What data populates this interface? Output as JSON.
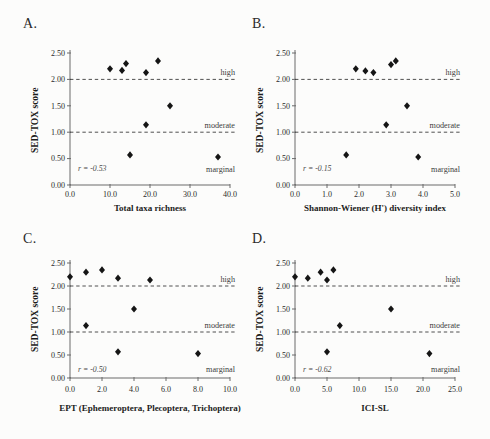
{
  "figure": {
    "background": "#fcfcfb",
    "text_color": "#1c1c1c",
    "marker_color": "#151515"
  },
  "chart_data": [
    {
      "type": "scatter",
      "panel": "A.",
      "xlabel": "Total taxa richness",
      "ylabel": "SED-TOX score",
      "xlim": [
        0,
        40
      ],
      "ylim": [
        0,
        2.5
      ],
      "x_tick_values": [
        0,
        10,
        20,
        30,
        40
      ],
      "x_tick_labels": [
        "0.0",
        "10.0",
        "20.0",
        "30.0",
        "40.0"
      ],
      "y_tick_values": [
        0,
        0.5,
        1,
        1.5,
        2,
        2.5
      ],
      "y_tick_labels": [
        "0.00",
        "0.50",
        "1.00",
        "1.50",
        "2.00",
        "2.50"
      ],
      "points": [
        [
          10,
          2.2
        ],
        [
          13,
          2.17
        ],
        [
          14,
          2.3
        ],
        [
          19,
          2.13
        ],
        [
          22,
          2.35
        ],
        [
          25,
          1.5
        ],
        [
          19,
          1.14
        ],
        [
          15,
          0.57
        ],
        [
          37,
          0.53
        ]
      ],
      "r_label": "r = -0.53",
      "reference_lines": [
        {
          "value": 2.0,
          "label": "high"
        },
        {
          "value": 1.0,
          "label": "moderate"
        }
      ],
      "marginal_label": "marginal",
      "legend": "none",
      "grid": false
    },
    {
      "type": "scatter",
      "panel": "B.",
      "xlabel": "Shannon-Wiener (H') diversity index",
      "ylabel": "SED-TOX score",
      "xlim": [
        0,
        5
      ],
      "ylim": [
        0,
        2.5
      ],
      "x_tick_values": [
        0,
        1,
        2,
        3,
        4,
        5
      ],
      "x_tick_labels": [
        "0.0",
        "1.0",
        "2.0",
        "3.0",
        "4.0",
        "5.0"
      ],
      "y_tick_values": [
        0,
        0.5,
        1,
        1.5,
        2,
        2.5
      ],
      "y_tick_labels": [
        "0.00",
        "0.50",
        "1.00",
        "1.50",
        "2.00",
        "2.50"
      ],
      "points": [
        [
          1.9,
          2.2
        ],
        [
          2.2,
          2.16
        ],
        [
          2.45,
          2.13
        ],
        [
          3.0,
          2.28
        ],
        [
          3.15,
          2.35
        ],
        [
          3.5,
          1.5
        ],
        [
          2.85,
          1.14
        ],
        [
          1.6,
          0.57
        ],
        [
          3.85,
          0.53
        ]
      ],
      "r_label": "r = -0.15",
      "reference_lines": [
        {
          "value": 2.0,
          "label": "high"
        },
        {
          "value": 1.0,
          "label": "moderate"
        }
      ],
      "marginal_label": "marginal",
      "legend": "none",
      "grid": false
    },
    {
      "type": "scatter",
      "panel": "C.",
      "xlabel": "EPT (Ephemeroptera, Plecoptera, Trichoptera)",
      "ylabel": "SED-TOX score",
      "xlim": [
        0,
        10
      ],
      "ylim": [
        0,
        2.5
      ],
      "x_tick_values": [
        0,
        2,
        4,
        6,
        8,
        10
      ],
      "x_tick_labels": [
        "0.0",
        "2.0",
        "4.0",
        "6.0",
        "8.0",
        "10.0"
      ],
      "y_tick_values": [
        0,
        0.5,
        1,
        1.5,
        2,
        2.5
      ],
      "y_tick_labels": [
        "0.00",
        "0.50",
        "1.00",
        "1.50",
        "2.00",
        "2.50"
      ],
      "points": [
        [
          0,
          2.2
        ],
        [
          1,
          2.3
        ],
        [
          2,
          2.35
        ],
        [
          3,
          2.17
        ],
        [
          5,
          2.13
        ],
        [
          4,
          1.5
        ],
        [
          1,
          1.14
        ],
        [
          3,
          0.57
        ],
        [
          8,
          0.53
        ]
      ],
      "r_label": "r = -0.50",
      "reference_lines": [
        {
          "value": 2.0,
          "label": "high"
        },
        {
          "value": 1.0,
          "label": "moderate"
        }
      ],
      "marginal_label": "marginal",
      "legend": "none",
      "grid": false
    },
    {
      "type": "scatter",
      "panel": "D.",
      "xlabel": "ICI-SL",
      "ylabel": "SED-TOX score",
      "xlim": [
        0,
        25
      ],
      "ylim": [
        0,
        2.5
      ],
      "x_tick_values": [
        0,
        5,
        10,
        15,
        20,
        25
      ],
      "x_tick_labels": [
        "0.0",
        "5.0",
        "10.0",
        "15.0",
        "20.0",
        "25.0"
      ],
      "y_tick_values": [
        0,
        0.5,
        1,
        1.5,
        2,
        2.5
      ],
      "y_tick_labels": [
        "0.00",
        "0.50",
        "1.00",
        "1.50",
        "2.00",
        "2.50"
      ],
      "points": [
        [
          0,
          2.2
        ],
        [
          2,
          2.17
        ],
        [
          4,
          2.3
        ],
        [
          5,
          2.13
        ],
        [
          6,
          2.35
        ],
        [
          15,
          1.5
        ],
        [
          7,
          1.14
        ],
        [
          5,
          0.57
        ],
        [
          21,
          0.53
        ]
      ],
      "r_label": "r = -0.62",
      "reference_lines": [
        {
          "value": 2.0,
          "label": "high"
        },
        {
          "value": 1.0,
          "label": "moderate"
        }
      ],
      "marginal_label": "marginal",
      "legend": "none",
      "grid": false
    }
  ]
}
